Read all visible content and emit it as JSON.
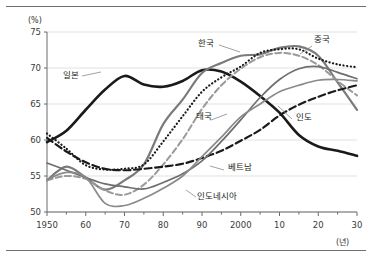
{
  "figure": {
    "unit_y": "(%)",
    "unit_x": "(년)"
  },
  "chart_data": {
    "type": "line",
    "title": "",
    "xlabel": "(년)",
    "ylabel": "(%)",
    "xlim": [
      1950,
      2030
    ],
    "ylim": [
      50,
      75
    ],
    "grid": true,
    "legend": "inline-annotations",
    "x": [
      1950,
      1955,
      1960,
      1965,
      1970,
      1975,
      1980,
      1985,
      1990,
      1995,
      2000,
      2005,
      2010,
      2015,
      2020,
      2025,
      2030
    ],
    "xtick_labels": [
      "1950",
      "60",
      "70",
      "80",
      "90",
      "2000",
      "10",
      "20",
      "30"
    ],
    "xtick_values": [
      1950,
      1960,
      1970,
      1980,
      1990,
      2000,
      2010,
      2020,
      2030
    ],
    "ytick_labels": [
      "50",
      "55",
      "60",
      "65",
      "70",
      "75"
    ],
    "ytick_values": [
      50,
      55,
      60,
      65,
      70,
      75
    ],
    "series": [
      {
        "name": "일본",
        "style": "solid-thick-black",
        "color": "#1a1a1a",
        "values": [
          59.7,
          61.3,
          64.2,
          67.0,
          68.9,
          67.7,
          67.4,
          68.2,
          69.7,
          69.5,
          68.1,
          66.1,
          63.8,
          60.7,
          59.1,
          58.5,
          57.8
        ]
      },
      {
        "name": "한국",
        "style": "solid-gray",
        "color": "#7a7a7a",
        "values": [
          54.4,
          56.3,
          54.8,
          53.1,
          54.4,
          56.6,
          62.2,
          65.6,
          69.3,
          70.7,
          71.7,
          71.9,
          72.8,
          73.0,
          71.7,
          68.0,
          64.2
        ]
      },
      {
        "name": "중국",
        "style": "dotted",
        "color": "#1a1a1a",
        "values": [
          60.9,
          58.8,
          56.5,
          55.9,
          56.0,
          56.6,
          59.8,
          63.3,
          66.7,
          68.7,
          70.2,
          72.1,
          72.6,
          72.6,
          71.3,
          70.5,
          70.1
        ]
      },
      {
        "name": "태국",
        "style": "dashed-gray",
        "color": "#9a9a9a",
        "values": [
          54.4,
          55.0,
          54.6,
          53.0,
          52.4,
          53.8,
          56.6,
          60.1,
          64.3,
          67.6,
          69.9,
          71.5,
          72.1,
          71.7,
          70.4,
          68.2,
          66.2
        ]
      },
      {
        "name": "인도",
        "style": "dashed-black",
        "color": "#1a1a1a",
        "values": [
          60.3,
          58.4,
          56.9,
          56.0,
          55.8,
          56.0,
          56.3,
          56.7,
          57.5,
          58.5,
          59.9,
          61.4,
          63.4,
          64.9,
          66.0,
          66.9,
          67.6
        ]
      },
      {
        "name": "베트남",
        "style": "solid-gray-thin",
        "color": "#6e6e6e",
        "values": [
          56.8,
          55.8,
          54.8,
          53.9,
          53.5,
          53.2,
          54.1,
          55.3,
          57.1,
          59.8,
          62.8,
          65.9,
          68.4,
          69.9,
          70.2,
          69.4,
          68.5
        ]
      },
      {
        "name": "인도네시아",
        "style": "solid-gray-thin",
        "color": "#8a8a8a",
        "values": [
          54.5,
          55.5,
          54.8,
          51.2,
          50.9,
          51.9,
          53.3,
          55.0,
          57.7,
          60.4,
          63.2,
          65.0,
          66.7,
          67.6,
          68.3,
          68.4,
          68.2
        ]
      }
    ],
    "annotations": [
      {
        "label": "일본",
        "x": 63,
        "y": 78
      },
      {
        "label": "한국",
        "x": 198,
        "y": 46
      },
      {
        "label": "중국",
        "x": 314,
        "y": 42
      },
      {
        "label": "태국",
        "x": 196,
        "y": 119
      },
      {
        "label": "인도",
        "x": 296,
        "y": 120
      },
      {
        "label": "베트남",
        "x": 228,
        "y": 170
      },
      {
        "label": "인도네시아",
        "x": 197,
        "y": 199
      }
    ]
  }
}
